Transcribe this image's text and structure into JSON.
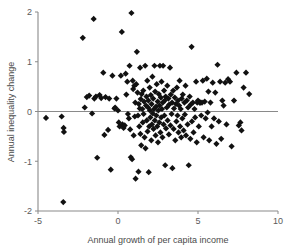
{
  "chart_data": {
    "type": "scatter",
    "title": "",
    "xlabel": "Annual growth of per capita income",
    "ylabel": "Annual inequality change",
    "xlim": [
      -5,
      10
    ],
    "ylim": [
      -2,
      2
    ],
    "xticks": [
      -5,
      0,
      5,
      10
    ],
    "yticks": [
      -2,
      -1,
      0,
      1,
      2
    ],
    "xtick_labels": [
      "-5",
      "0",
      "5",
      "10"
    ],
    "ytick_labels": [
      "-2",
      "-1",
      "0",
      "1",
      "2"
    ],
    "grid": false,
    "legend": null,
    "marker": "diamond",
    "marker_color": "#111111",
    "marker_size": 3.1,
    "reference_lines": [
      {
        "axis": "y",
        "value": 0,
        "color": "#8a8a8a"
      }
    ],
    "series": [
      {
        "name": "countries",
        "points": [
          [
            -4.5,
            -0.13
          ],
          [
            -3.52,
            -0.1
          ],
          [
            -3.4,
            -0.33
          ],
          [
            -3.38,
            -0.41
          ],
          [
            -3.42,
            -1.82
          ],
          [
            -2.2,
            1.48
          ],
          [
            -2.08,
            0.08
          ],
          [
            -1.95,
            0.29
          ],
          [
            -1.8,
            0.32
          ],
          [
            -1.62,
            -0.04
          ],
          [
            -1.52,
            1.86
          ],
          [
            -1.48,
            0.26
          ],
          [
            -1.38,
            0.3
          ],
          [
            -1.3,
            -0.93
          ],
          [
            -1.15,
            0.33
          ],
          [
            -1.05,
            0.27
          ],
          [
            -0.92,
            0.78
          ],
          [
            -0.85,
            -0.47
          ],
          [
            -0.78,
            0.29
          ],
          [
            -0.62,
            -0.37
          ],
          [
            -0.55,
            0.26
          ],
          [
            -0.45,
            -1.17
          ],
          [
            -0.35,
            0.72
          ],
          [
            -0.22,
            0.06
          ],
          [
            -0.18,
            0.08
          ],
          [
            -0.1,
            0.26
          ],
          [
            0.0,
            0.02
          ],
          [
            0.05,
            -0.22
          ],
          [
            0.1,
            -0.3
          ],
          [
            0.18,
            0.72
          ],
          [
            0.24,
            1.6
          ],
          [
            0.28,
            -0.26
          ],
          [
            0.35,
            -0.33
          ],
          [
            0.42,
            -0.28
          ],
          [
            0.48,
            0.76
          ],
          [
            0.52,
            0.34
          ],
          [
            0.58,
            0.6
          ],
          [
            0.62,
            -0.05
          ],
          [
            0.68,
            -0.14
          ],
          [
            0.72,
            0.92
          ],
          [
            0.76,
            -0.36
          ],
          [
            0.8,
            -0.92
          ],
          [
            0.84,
            1.98
          ],
          [
            0.88,
            -0.96
          ],
          [
            0.92,
            0.62
          ],
          [
            0.95,
            0.45
          ],
          [
            0.98,
            -0.48
          ],
          [
            1.02,
            0.52
          ],
          [
            1.05,
            -0.1
          ],
          [
            1.08,
            0.18
          ],
          [
            1.1,
            -1.35
          ],
          [
            1.14,
            0.55
          ],
          [
            1.18,
            1.2
          ],
          [
            1.22,
            0.38
          ],
          [
            1.25,
            -0.08
          ],
          [
            1.28,
            -1.21
          ],
          [
            1.3,
            0.15
          ],
          [
            1.33,
            -0.3
          ],
          [
            1.36,
            0.06
          ],
          [
            1.38,
            0.88
          ],
          [
            1.4,
            -0.45
          ],
          [
            1.42,
            0.25
          ],
          [
            1.45,
            -0.68
          ],
          [
            1.48,
            0.35
          ],
          [
            1.52,
            0.05
          ],
          [
            1.55,
            -0.22
          ],
          [
            1.58,
            0.42
          ],
          [
            1.6,
            -0.05
          ],
          [
            1.63,
            0.2
          ],
          [
            1.66,
            -0.52
          ],
          [
            1.7,
            0.92
          ],
          [
            1.72,
            -0.74
          ],
          [
            1.75,
            0.12
          ],
          [
            1.78,
            0.3
          ],
          [
            1.8,
            -0.18
          ],
          [
            1.83,
            0.62
          ],
          [
            1.85,
            -0.4
          ],
          [
            1.88,
            0.08
          ],
          [
            1.9,
            0.22
          ],
          [
            1.92,
            -1.22
          ],
          [
            1.95,
            -0.3
          ],
          [
            1.98,
            0.48
          ],
          [
            2.0,
            0.02
          ],
          [
            2.02,
            -0.12
          ],
          [
            2.05,
            0.33
          ],
          [
            2.08,
            -0.58
          ],
          [
            2.1,
            0.15
          ],
          [
            2.12,
            -0.26
          ],
          [
            2.15,
            0.7
          ],
          [
            2.18,
            -0.04
          ],
          [
            2.2,
            0.26
          ],
          [
            2.22,
            -0.35
          ],
          [
            2.25,
            0.05
          ],
          [
            2.28,
            0.92
          ],
          [
            2.3,
            -0.18
          ],
          [
            2.32,
            0.4
          ],
          [
            2.35,
            -0.48
          ],
          [
            2.38,
            0.1
          ],
          [
            2.4,
            -0.08
          ],
          [
            2.42,
            0.55
          ],
          [
            2.45,
            -0.3
          ],
          [
            2.48,
            0.2
          ],
          [
            2.5,
            -0.62
          ],
          [
            2.52,
            0.02
          ],
          [
            2.55,
            0.35
          ],
          [
            2.58,
            -0.22
          ],
          [
            2.6,
            0.12
          ],
          [
            2.62,
            0.92
          ],
          [
            2.65,
            -0.42
          ],
          [
            2.68,
            0.28
          ],
          [
            2.7,
            -0.12
          ],
          [
            2.72,
            0.6
          ],
          [
            2.75,
            0.05
          ],
          [
            2.78,
            -0.52
          ],
          [
            2.8,
            0.18
          ],
          [
            2.82,
            0.92
          ],
          [
            2.85,
            -0.26
          ],
          [
            2.88,
            0.42
          ],
          [
            2.9,
            -0.08
          ],
          [
            2.92,
            0.22
          ],
          [
            2.95,
            -1.08
          ],
          [
            2.98,
            0.3
          ],
          [
            3.0,
            -0.34
          ],
          [
            3.05,
            0.08
          ],
          [
            3.08,
            0.52
          ],
          [
            3.1,
            -0.18
          ],
          [
            3.15,
            0.26
          ],
          [
            3.18,
            -0.46
          ],
          [
            3.2,
            0.14
          ],
          [
            3.25,
            0.88
          ],
          [
            3.28,
            -0.28
          ],
          [
            3.3,
            0.34
          ],
          [
            3.35,
            -0.05
          ],
          [
            3.38,
            0.18
          ],
          [
            3.4,
            -1.14
          ],
          [
            3.45,
            0.42
          ],
          [
            3.48,
            -0.35
          ],
          [
            3.5,
            0.06
          ],
          [
            3.55,
            0.28
          ],
          [
            3.58,
            -0.58
          ],
          [
            3.62,
            0.15
          ],
          [
            3.65,
            -0.2
          ],
          [
            3.68,
            0.48
          ],
          [
            3.72,
            -0.08
          ],
          [
            3.75,
            0.22
          ],
          [
            3.78,
            -0.42
          ],
          [
            3.82,
            0.12
          ],
          [
            3.85,
            0.62
          ],
          [
            3.88,
            -0.3
          ],
          [
            3.92,
            0.05
          ],
          [
            3.95,
            -0.52
          ],
          [
            3.98,
            0.26
          ],
          [
            4.02,
            -0.14
          ],
          [
            4.05,
            0.34
          ],
          [
            4.1,
            -0.38
          ],
          [
            4.15,
            0.18
          ],
          [
            4.18,
            -0.06
          ],
          [
            4.22,
            0.52
          ],
          [
            4.25,
            -0.48
          ],
          [
            4.3,
            0.22
          ],
          [
            4.35,
            -0.26
          ],
          [
            4.38,
            0.08
          ],
          [
            4.42,
            -1.08
          ],
          [
            4.48,
            0.3
          ],
          [
            4.52,
            -0.55
          ],
          [
            4.55,
            0.14
          ],
          [
            4.6,
            1.3
          ],
          [
            4.62,
            -0.2
          ],
          [
            4.68,
            0.18
          ],
          [
            4.72,
            -0.42
          ],
          [
            4.78,
            0.05
          ],
          [
            4.82,
            -0.12
          ],
          [
            4.88,
            0.6
          ],
          [
            4.92,
            -0.62
          ],
          [
            4.95,
            0.18
          ],
          [
            5.0,
            0.22
          ],
          [
            5.05,
            -0.3
          ],
          [
            5.1,
            0.18
          ],
          [
            5.15,
            0.18
          ],
          [
            5.2,
            -0.08
          ],
          [
            5.25,
            0.18
          ],
          [
            5.3,
            0.62
          ],
          [
            5.35,
            -0.52
          ],
          [
            5.42,
            0.2
          ],
          [
            5.48,
            -0.14
          ],
          [
            5.55,
            0.66
          ],
          [
            5.6,
            -0.02
          ],
          [
            5.65,
            0.4
          ],
          [
            5.7,
            -0.58
          ],
          [
            5.78,
            0.18
          ],
          [
            5.85,
            -0.3
          ],
          [
            5.92,
            0.58
          ],
          [
            6.0,
            -0.14
          ],
          [
            6.08,
            0.38
          ],
          [
            6.15,
            -0.65
          ],
          [
            6.22,
            0.94
          ],
          [
            6.3,
            -0.2
          ],
          [
            6.38,
            0.6
          ],
          [
            6.45,
            -0.55
          ],
          [
            6.52,
            0.22
          ],
          [
            6.6,
            0.12
          ],
          [
            6.7,
            0.58
          ],
          [
            6.78,
            -0.26
          ],
          [
            6.88,
            0.65
          ],
          [
            7.0,
            0.6
          ],
          [
            7.1,
            -0.7
          ],
          [
            7.25,
            0.22
          ],
          [
            7.4,
            0.78
          ],
          [
            7.55,
            -0.28
          ],
          [
            7.65,
            -0.22
          ],
          [
            7.72,
            -0.38
          ],
          [
            7.85,
            0.48
          ],
          [
            8.0,
            0.78
          ],
          [
            8.2,
            0.35
          ]
        ]
      }
    ]
  },
  "axes": {
    "x_title": "Annual growth of per capita income",
    "y_title": "Annual inequality change"
  }
}
